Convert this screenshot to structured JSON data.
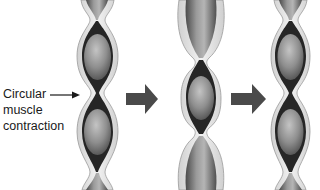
{
  "figure": {
    "label": {
      "lines": [
        "Circular",
        "muscle",
        "contraction"
      ],
      "pointer": "arrow pointing to constriction between two food boluses"
    },
    "stages": [
      {
        "id": "stage-1",
        "description": "Two boluses separated by circular muscle contraction"
      },
      {
        "id": "stage-2",
        "description": "Bolus pushed forward; tube relaxed above and below"
      },
      {
        "id": "stage-3",
        "description": "Tube contracts again behind the bolus"
      }
    ],
    "arrows": [
      "stage-1-to-stage-2",
      "stage-2-to-stage-3"
    ],
    "colors": {
      "tube_wall_outer": "#e8e8e8",
      "tube_wall_edge": "#9a9a9a",
      "lumen_dark": "#2a2a2a",
      "bolus_light": "#b8b8b8",
      "bolus_dark": "#5a5a5a",
      "arrow": "#4a4a4a",
      "text": "#1a1a1a"
    }
  }
}
